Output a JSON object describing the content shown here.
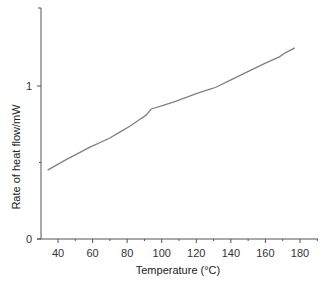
{
  "chart_data": {
    "type": "line",
    "title": "",
    "xlabel": "Temperature (°C)",
    "ylabel": "Rate of heat flow/mW",
    "xlim": [
      30,
      190
    ],
    "ylim": [
      0,
      1.5
    ],
    "grid": false,
    "legend": null,
    "x_ticks": [
      40,
      60,
      80,
      100,
      120,
      140,
      160,
      180
    ],
    "x_minor_ticks": [
      50,
      70,
      90,
      110,
      130,
      150,
      170,
      190
    ],
    "y_ticks": [
      0,
      1
    ],
    "y_tick_labels": [
      "0",
      "1"
    ],
    "y_minor_ticks": [
      0.5
    ],
    "series": [
      {
        "name": "heat flow",
        "color": "#808080",
        "x": [
          34,
          45,
          58.5,
          70,
          76,
          82,
          87,
          91,
          94,
          100,
          108,
          120,
          128,
          131,
          140,
          151,
          160,
          168,
          172,
          177
        ],
        "y": [
          0.45,
          0.52,
          0.6,
          0.66,
          0.7,
          0.74,
          0.78,
          0.81,
          0.85,
          0.87,
          0.9,
          0.95,
          0.98,
          0.99,
          1.04,
          1.1,
          1.15,
          1.19,
          1.22,
          1.25
        ]
      }
    ]
  }
}
